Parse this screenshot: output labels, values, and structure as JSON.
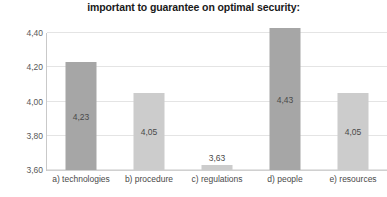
{
  "chart_data": {
    "type": "bar",
    "title": "important to guarantee on optimal security:",
    "xlabel": "",
    "ylabel": "",
    "categories": [
      "a) technologies",
      "b) procedure",
      "c) regulations",
      "d) people",
      "e) resources"
    ],
    "values": [
      4.23,
      4.05,
      3.63,
      4.43,
      4.05
    ],
    "value_labels": [
      "4,23",
      "4,05",
      "3,63",
      "4,43",
      "4,05"
    ],
    "bar_colors": [
      "#a6a6a6",
      "#cccccc",
      "#cccccc",
      "#a6a6a6",
      "#cccccc"
    ],
    "ylim": [
      3.6,
      4.4
    ],
    "ytick_values": [
      3.6,
      3.8,
      4.0,
      4.2,
      4.4
    ],
    "ytick_labels": [
      "3,60",
      "3,80",
      "4,00",
      "4,20",
      "4,40"
    ],
    "grid": true,
    "legend": "none",
    "decimal_separator": ","
  }
}
